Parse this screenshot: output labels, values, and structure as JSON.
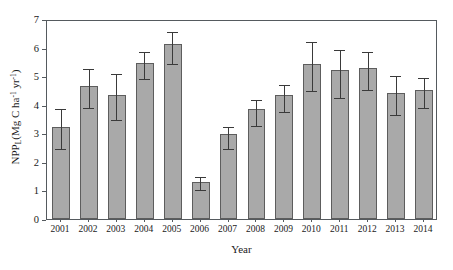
{
  "chart_data": {
    "type": "bar",
    "title": "",
    "xlabel": "Year",
    "ylabel": "NPP_L (Mg C ha^-1 yr^-1)",
    "ylabel_parts": {
      "prefix": "NPP",
      "subscript": "L",
      "open": "(Mg C ha",
      "sup1": "-1",
      "mid": " yr",
      "sup2": "-1",
      "close": ")"
    },
    "categories": [
      "2001",
      "2002",
      "2003",
      "2004",
      "2005",
      "2006",
      "2007",
      "2008",
      "2009",
      "2010",
      "2011",
      "2012",
      "2013",
      "2014"
    ],
    "values": [
      3.22,
      4.65,
      4.34,
      5.45,
      6.14,
      1.31,
      2.97,
      3.86,
      4.33,
      5.43,
      5.2,
      5.29,
      4.41,
      4.52
    ],
    "errors_upper": [
      3.93,
      5.33,
      5.14,
      5.93,
      6.62,
      1.55,
      3.3,
      4.25,
      4.75,
      6.25,
      5.99,
      5.92,
      5.06,
      5.02
    ],
    "errors_lower": [
      2.53,
      3.96,
      3.52,
      4.96,
      5.51,
      1.08,
      2.51,
      3.33,
      3.82,
      4.55,
      4.32,
      4.6,
      3.71,
      3.97
    ],
    "ylim": [
      0,
      7
    ],
    "yticks": [
      0,
      1,
      2,
      3,
      4,
      5,
      6,
      7
    ],
    "ytick_labels": [
      "0",
      "1",
      "2",
      "3",
      "4",
      "5",
      "6",
      "7"
    ],
    "xlim_grid": false,
    "grid": false,
    "legend": null,
    "legend_position": "none",
    "bar_color": "#a9a9a9",
    "bar_edge_color": "#5d5d5d",
    "error_color": "#3a3a3a",
    "axis_color": "#555a5e",
    "background": "#ffffff"
  }
}
